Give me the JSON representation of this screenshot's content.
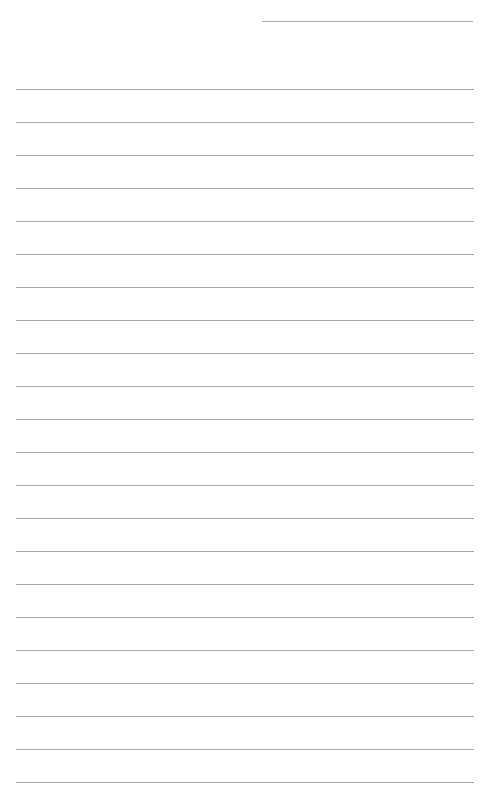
{
  "page": {
    "type": "lined-paper",
    "header_line": {
      "left": 262,
      "top": 21,
      "width": 211
    },
    "rules": {
      "count": 22,
      "first_top": 89,
      "spacing": 33,
      "left": 16,
      "width": 458
    },
    "line_color": "#a8a8a8",
    "background": "#ffffff"
  }
}
